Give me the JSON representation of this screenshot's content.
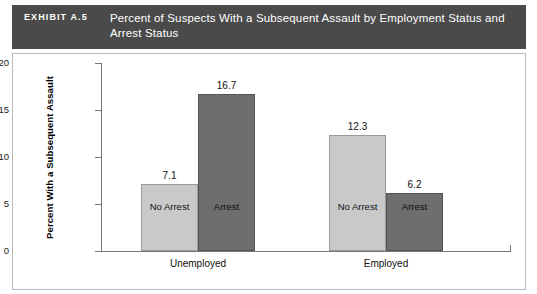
{
  "header": {
    "exhibit_number": "EXHIBIT A.5",
    "title": "Percent of Suspects With a Subsequent Assault by Employment Status and Arrest Status"
  },
  "chart_data": {
    "type": "bar",
    "title": "Percent of Suspects With a Subsequent Assault by Employment Status and Arrest Status",
    "xlabel": "",
    "ylabel": "Percent With a Subsequent Assault",
    "categories": [
      "Unemployed",
      "Employed"
    ],
    "ylim": [
      0,
      20
    ],
    "yticks": [
      0,
      5,
      10,
      15,
      20
    ],
    "ytick_labels": [
      "0",
      "5",
      "10",
      "15",
      "20"
    ],
    "grid": false,
    "legend_position": "in-bar",
    "series": [
      {
        "name": "No Arrest",
        "color": "#c9c9c9",
        "values": [
          7.1,
          12.3
        ],
        "value_labels": [
          "7.1",
          "12.3"
        ]
      },
      {
        "name": "Arrest",
        "color": "#6e6e6e",
        "values": [
          16.7,
          6.2
        ],
        "value_labels": [
          "16.7",
          "6.2"
        ]
      }
    ]
  }
}
